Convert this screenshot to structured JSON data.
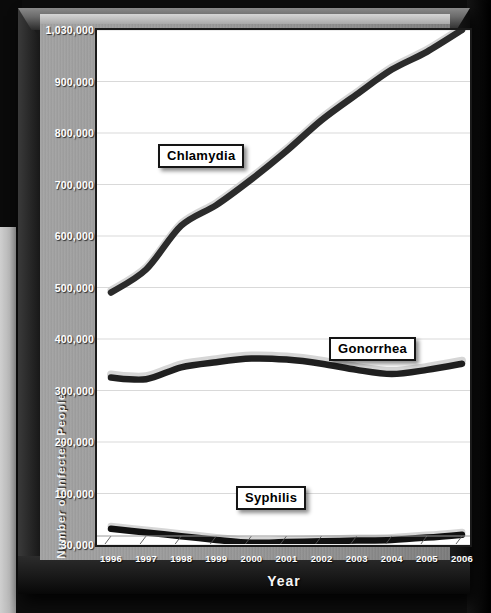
{
  "chart_data": {
    "type": "line",
    "title": "",
    "xlabel": "Year",
    "ylabel": "Number of Infected People",
    "categories": [
      "1996",
      "1997",
      "1998",
      "1999",
      "2000",
      "2001",
      "2002",
      "2003",
      "2004",
      "2005",
      "2006"
    ],
    "x": [
      1996,
      1997,
      1998,
      1999,
      2000,
      2001,
      2002,
      2003,
      2004,
      2005,
      2006
    ],
    "ylim": [
      30000,
      1030000
    ],
    "y_ticks": [
      30000,
      100000,
      200000,
      300000,
      400000,
      500000,
      600000,
      700000,
      800000,
      900000,
      1030000
    ],
    "y_tick_labels": [
      "30,000",
      "100,000",
      "200,000",
      "300,000",
      "400,000",
      "500,000",
      "600,000",
      "700,000",
      "800,000",
      "900,000",
      "1,030,000"
    ],
    "grid": true,
    "grid_axis": "y",
    "legend_position": "inline-callouts",
    "series": [
      {
        "name": "Chlamydia",
        "color": "#2b2b2b",
        "values": [
          490000,
          535000,
          620000,
          660000,
          710000,
          765000,
          825000,
          875000,
          930000,
          975000,
          1030000
        ]
      },
      {
        "name": "Gonorrhea",
        "color": "#1f1f1f",
        "highlight": "#d6d6d6",
        "values": [
          325000,
          322000,
          345000,
          355000,
          362000,
          360000,
          352000,
          340000,
          332000,
          340000,
          352000
        ]
      },
      {
        "name": "Syphilis",
        "color": "#111111",
        "values": [
          52000,
          47000,
          42000,
          37000,
          33000,
          34000,
          35000,
          36000,
          37000,
          40000,
          44000
        ]
      }
    ],
    "annotations": [
      {
        "text": "Chlamydia",
        "kind": "series-callout"
      },
      {
        "text": "Gonorrhea",
        "kind": "series-callout"
      },
      {
        "text": "Syphilis",
        "kind": "series-callout"
      }
    ]
  },
  "axes": {
    "y_title": "Number of Infected People",
    "x_title": "Year"
  },
  "colors": {
    "plot_background": "#ffffff",
    "panel_background": "#9b9b9b",
    "frame": "#1b1b1b",
    "grid": "#d9d9d9",
    "tick_text": "#ffffff",
    "callout_text": "#000000"
  }
}
